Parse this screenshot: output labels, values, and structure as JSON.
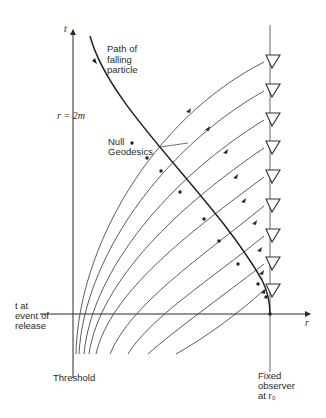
{
  "figure": {
    "axes": {
      "t_label": "t",
      "r_label": "r",
      "horizon_label": "r = 2m"
    },
    "labels": {
      "particle_path": [
        "Path of",
        "falling",
        "particle"
      ],
      "null_geodesics": [
        "Null",
        "Geodesics"
      ],
      "release_event": [
        "t at",
        "event of",
        "release"
      ],
      "threshold": "Threshold",
      "observer": [
        "Fixed",
        "observer",
        "at r₀"
      ]
    },
    "observer_marker_count": 9,
    "null_geodesic_count": 9,
    "colors": {
      "ink": "#2a2a2a",
      "background": "#ffffff"
    }
  }
}
